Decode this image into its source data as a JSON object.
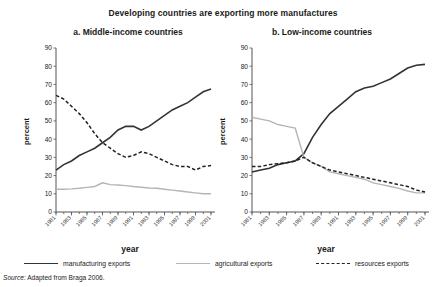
{
  "figure": {
    "title": "Developing countries are exporting more manufactures",
    "source_prefix": "Source:",
    "source_text": "Adapted from Braga 2006."
  },
  "legend": {
    "manufacturing": "manufacturing exports",
    "agricultural": "agricultural exports",
    "resources": "resources exports"
  },
  "colors": {
    "manufacturing": "#333333",
    "agricultural": "#b5b5b5",
    "resources": "#222222",
    "axis": "#555555",
    "background": "#ffffff"
  },
  "chart_data": [
    {
      "type": "line",
      "title": "a. Middle-income countries",
      "xlabel": "year",
      "ylabel": "percent",
      "ylim": [
        0,
        90
      ],
      "ytick_step": 10,
      "yticks": [
        0,
        10,
        20,
        30,
        40,
        50,
        60,
        70,
        80,
        90
      ],
      "grid": false,
      "legend_position": "bottom",
      "x": [
        1981,
        1982,
        1983,
        1984,
        1985,
        1986,
        1987,
        1988,
        1989,
        1990,
        1991,
        1992,
        1993,
        1994,
        1995,
        1996,
        1997,
        1998,
        1999,
        2000,
        2001
      ],
      "xticklabels": [
        "1981",
        "1983",
        "1985",
        "1987",
        "1989",
        "1991",
        "1993",
        "1995",
        "1997",
        "1999",
        "2001"
      ],
      "xtick_values": [
        1981,
        1983,
        1985,
        1987,
        1989,
        1991,
        1993,
        1995,
        1997,
        1999,
        2001
      ],
      "series": [
        {
          "name": "manufacturing exports",
          "style": "solid",
          "color": "#333333",
          "values": [
            23,
            26,
            28,
            31,
            33,
            35,
            38,
            41,
            45,
            47,
            47,
            45,
            47,
            50,
            53,
            56,
            58,
            60,
            63,
            66,
            67.5
          ]
        },
        {
          "name": "agricultural exports",
          "style": "solid-light",
          "color": "#b5b5b5",
          "values": [
            12.5,
            12.5,
            12.7,
            13,
            13.5,
            14,
            16,
            15,
            14.8,
            14.5,
            14,
            13.6,
            13.2,
            13,
            12.5,
            12,
            11.5,
            11,
            10.5,
            10,
            10
          ]
        },
        {
          "name": "resources exports",
          "style": "dashed",
          "color": "#222222",
          "values": [
            64,
            62,
            58,
            54,
            49,
            43,
            38,
            35,
            32,
            30,
            31,
            33,
            32,
            30,
            28,
            26,
            25,
            25,
            23,
            25,
            25.5
          ]
        }
      ]
    },
    {
      "type": "line",
      "title": "b. Low-income countries",
      "xlabel": "year",
      "ylabel": "percent",
      "ylim": [
        0,
        90
      ],
      "ytick_step": 10,
      "yticks": [
        0,
        10,
        20,
        30,
        40,
        50,
        60,
        70,
        80,
        90
      ],
      "grid": false,
      "legend_position": "bottom",
      "x": [
        1981,
        1982,
        1983,
        1984,
        1985,
        1986,
        1987,
        1988,
        1989,
        1990,
        1991,
        1992,
        1993,
        1994,
        1995,
        1996,
        1997,
        1998,
        1999,
        2000,
        2001
      ],
      "xticklabels": [
        "1981",
        "1983",
        "1985",
        "1987",
        "1989",
        "1991",
        "1993",
        "1995",
        "1997",
        "1999",
        "2001"
      ],
      "xtick_values": [
        1981,
        1983,
        1985,
        1987,
        1989,
        1991,
        1993,
        1995,
        1997,
        1999,
        2001
      ],
      "series": [
        {
          "name": "manufacturing exports",
          "style": "solid",
          "color": "#333333",
          "values": [
            22,
            23,
            24,
            26,
            27,
            28,
            32,
            41,
            48,
            54,
            58,
            62,
            66,
            68,
            69,
            71,
            73,
            76,
            79,
            80.5,
            81
          ]
        },
        {
          "name": "agricultural exports",
          "style": "solid-light",
          "color": "#b5b5b5",
          "values": [
            52,
            51,
            50,
            48,
            47,
            46,
            30,
            27,
            25,
            22,
            21,
            20,
            19,
            18,
            16,
            15,
            14,
            13,
            11.5,
            10.5,
            10.5
          ]
        },
        {
          "name": "resources exports",
          "style": "dashed",
          "color": "#222222",
          "values": [
            25,
            25,
            26,
            26.5,
            27,
            28,
            30,
            27,
            25,
            23,
            22,
            21,
            20,
            19,
            18,
            17,
            16,
            15,
            14,
            12,
            11
          ]
        }
      ]
    }
  ]
}
